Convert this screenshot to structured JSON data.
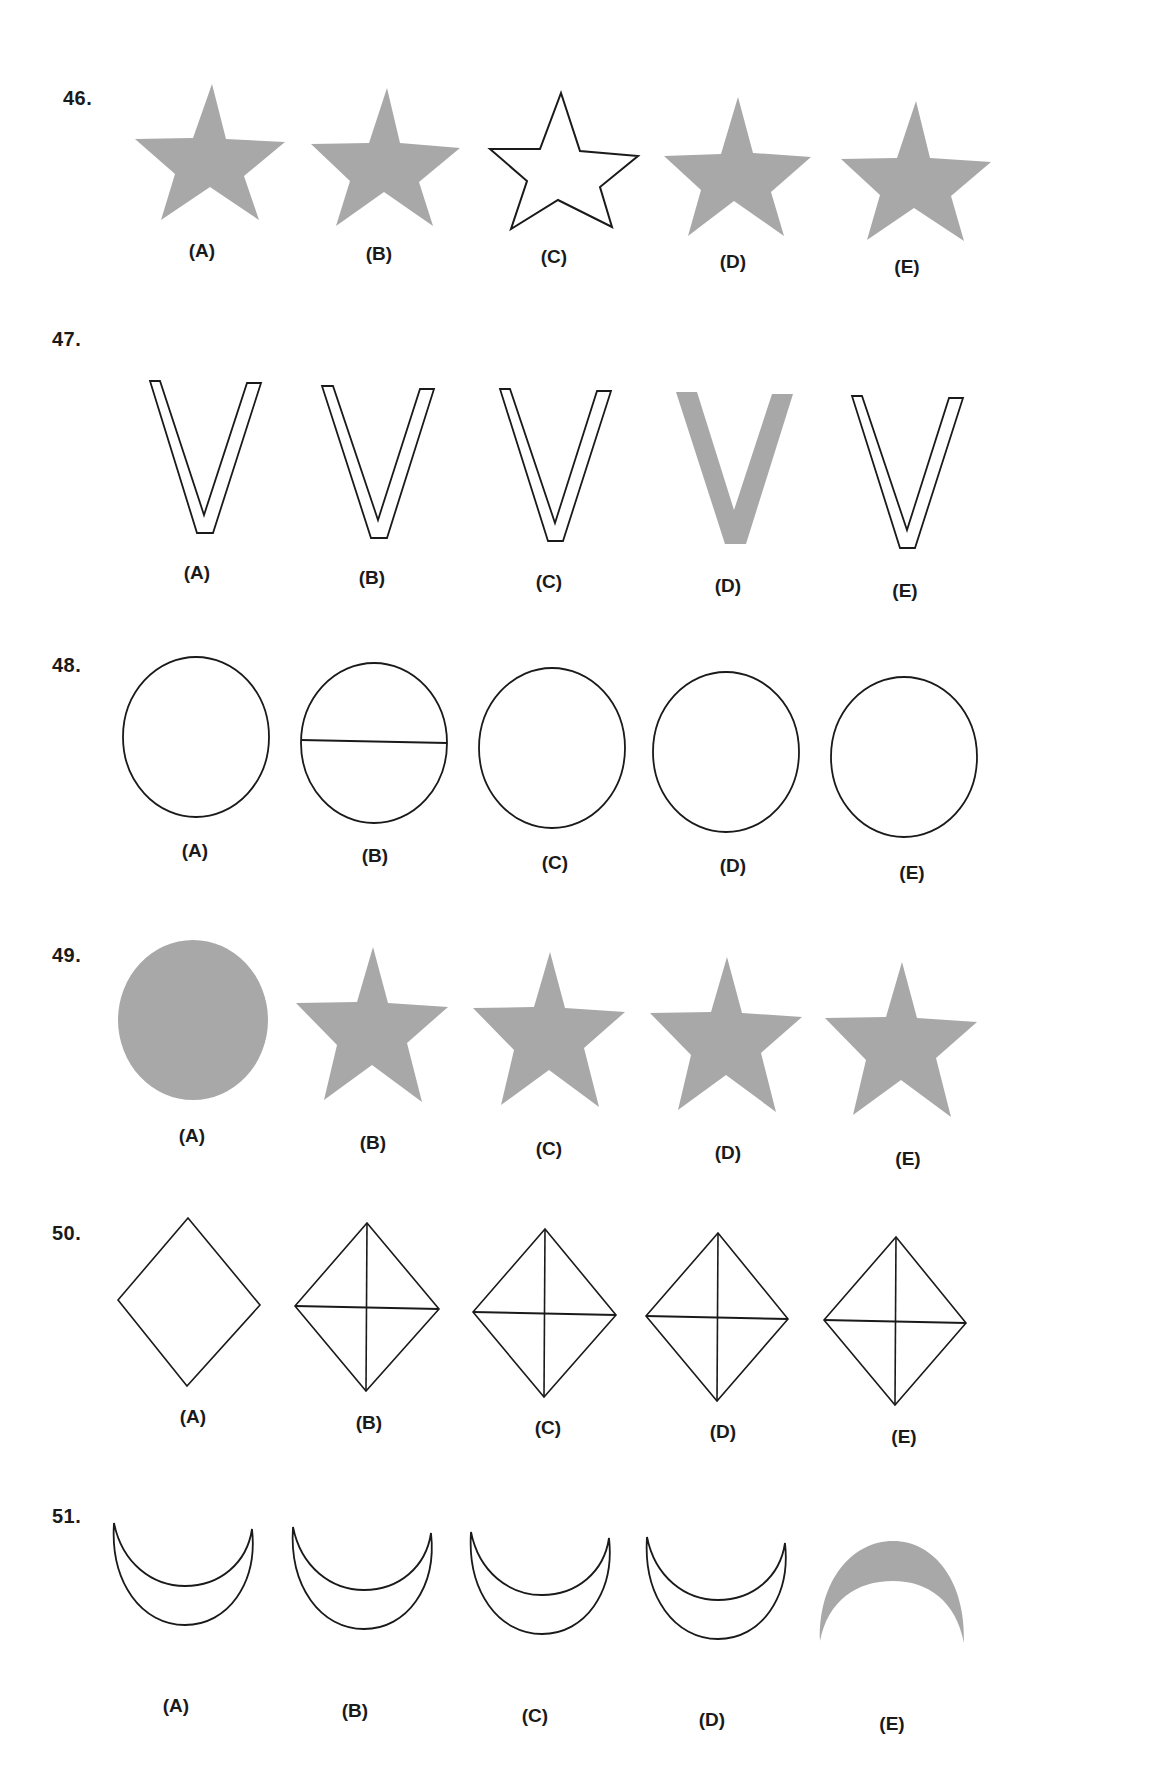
{
  "page": {
    "fill_gray": "#a8a8a8",
    "stroke_color": "#1a1a1a"
  },
  "questions": [
    {
      "number": "46.",
      "shape_type": "star",
      "options": [
        {
          "label": "(A)",
          "shape": "star",
          "style": "filled"
        },
        {
          "label": "(B)",
          "shape": "star",
          "style": "filled"
        },
        {
          "label": "(C)",
          "shape": "star",
          "style": "outline"
        },
        {
          "label": "(D)",
          "shape": "star",
          "style": "filled"
        },
        {
          "label": "(E)",
          "shape": "star",
          "style": "filled"
        }
      ]
    },
    {
      "number": "47.",
      "shape_type": "v-letter",
      "options": [
        {
          "label": "(A)",
          "shape": "v",
          "style": "outline"
        },
        {
          "label": "(B)",
          "shape": "v",
          "style": "outline"
        },
        {
          "label": "(C)",
          "shape": "v",
          "style": "outline"
        },
        {
          "label": "(D)",
          "shape": "v",
          "style": "filled"
        },
        {
          "label": "(E)",
          "shape": "v",
          "style": "outline"
        }
      ]
    },
    {
      "number": "48.",
      "shape_type": "circle",
      "options": [
        {
          "label": "(A)",
          "shape": "circle",
          "style": "outline"
        },
        {
          "label": "(B)",
          "shape": "circle",
          "style": "outline-with-line"
        },
        {
          "label": "(C)",
          "shape": "circle",
          "style": "outline"
        },
        {
          "label": "(D)",
          "shape": "circle",
          "style": "outline"
        },
        {
          "label": "(E)",
          "shape": "circle",
          "style": "outline"
        }
      ]
    },
    {
      "number": "49.",
      "shape_type": "circle-star",
      "options": [
        {
          "label": "(A)",
          "shape": "circle",
          "style": "filled"
        },
        {
          "label": "(B)",
          "shape": "star",
          "style": "filled"
        },
        {
          "label": "(C)",
          "shape": "star",
          "style": "filled"
        },
        {
          "label": "(D)",
          "shape": "star",
          "style": "filled"
        },
        {
          "label": "(E)",
          "shape": "star",
          "style": "filled"
        }
      ]
    },
    {
      "number": "50.",
      "shape_type": "diamond",
      "options": [
        {
          "label": "(A)",
          "shape": "diamond",
          "style": "outline"
        },
        {
          "label": "(B)",
          "shape": "diamond",
          "style": "outline-with-cross"
        },
        {
          "label": "(C)",
          "shape": "diamond",
          "style": "outline-with-cross"
        },
        {
          "label": "(D)",
          "shape": "diamond",
          "style": "outline-with-cross"
        },
        {
          "label": "(E)",
          "shape": "diamond",
          "style": "outline-with-cross"
        }
      ]
    },
    {
      "number": "51.",
      "shape_type": "crescent",
      "options": [
        {
          "label": "(A)",
          "shape": "crescent",
          "style": "outline-up"
        },
        {
          "label": "(B)",
          "shape": "crescent",
          "style": "outline-up"
        },
        {
          "label": "(C)",
          "shape": "crescent",
          "style": "outline-up"
        },
        {
          "label": "(D)",
          "shape": "crescent",
          "style": "outline-up"
        },
        {
          "label": "(E)",
          "shape": "crescent",
          "style": "filled-down"
        }
      ]
    }
  ]
}
